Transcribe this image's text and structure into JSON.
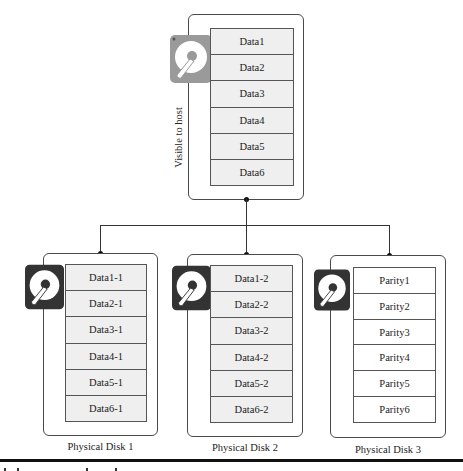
{
  "logical_volume": {
    "side_label": "Visible to host",
    "icon": "hard-disk-icon",
    "icon_color": "#9a9a9a",
    "blocks": [
      "Data1",
      "Data2",
      "Data3",
      "Data4",
      "Data5",
      "Data6"
    ]
  },
  "physical_disks": [
    {
      "label": "Physical Disk 1",
      "icon": "hard-disk-icon",
      "icon_color": "#333333",
      "blocks": [
        "Data1-1",
        "Data2-1",
        "Data3-1",
        "Data4-1",
        "Data5-1",
        "Data6-1"
      ]
    },
    {
      "label": "Physical Disk 2",
      "icon": "hard-disk-icon",
      "icon_color": "#333333",
      "blocks": [
        "Data1-2",
        "Data2-2",
        "Data3-2",
        "Data4-2",
        "Data5-2",
        "Data6-2"
      ]
    },
    {
      "label": "Physical Disk 3",
      "icon": "hard-disk-icon",
      "icon_color": "#333333",
      "blocks": [
        "Parity1",
        "Parity2",
        "Parity3",
        "Parity4",
        "Parity5",
        "Parity6"
      ]
    }
  ],
  "colors": {
    "data_block_fill": "#efefef",
    "parity_block_fill": "#ffffff",
    "border": "#4a4a4a"
  }
}
